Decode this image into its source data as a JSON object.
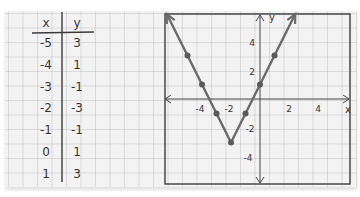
{
  "table": {
    "headers": [
      "x",
      "y"
    ],
    "rows": [
      [
        "-5",
        "3"
      ],
      [
        "-4",
        "1"
      ],
      [
        "-3",
        "-1"
      ],
      [
        "-2",
        "-3"
      ],
      [
        "-1",
        "-1"
      ],
      [
        "0",
        "1"
      ],
      [
        "1",
        "3"
      ]
    ]
  },
  "graph": {
    "x_axis_label": "x",
    "y_axis_label": "y",
    "x_ticks": [
      "-4",
      "-2",
      "2",
      "4"
    ],
    "y_ticks": [
      "4",
      "2",
      "-2",
      "-4"
    ],
    "line_color": "#6b6b6b",
    "point_color": "#5a5a5a"
  },
  "chart_data": {
    "type": "line",
    "title": "",
    "xlabel": "x",
    "ylabel": "y",
    "x": [
      -5,
      -4,
      -3,
      -2,
      -1,
      0,
      1
    ],
    "series": [
      {
        "name": "y = 2|x + 2| - 3",
        "values": [
          3,
          1,
          -1,
          -3,
          -1,
          1,
          3
        ]
      }
    ],
    "xlim": [
      -6.5,
      6.3
    ],
    "ylim": [
      -6,
      6
    ],
    "x_tick_labels": [
      -4,
      -2,
      2,
      4
    ],
    "y_tick_labels": [
      -4,
      -2,
      2,
      4
    ],
    "grid": true,
    "arrows_on_ends": true
  }
}
